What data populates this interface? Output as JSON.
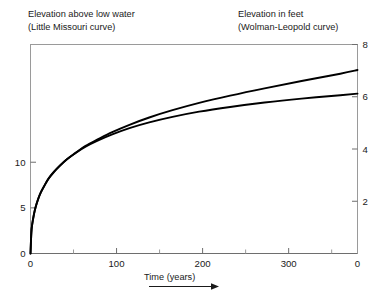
{
  "figure": {
    "caption_left": {
      "line1": "Elevation above low water",
      "line2": "(Little Missouri curve)"
    },
    "caption_right": {
      "line1": "Elevation in feet",
      "line2": "(Wolman-Leopold curve)"
    },
    "arrow_icon": "right-arrow-icon"
  },
  "chart_data": {
    "type": "line",
    "title": "",
    "xlabel": "Time (years)",
    "ylabel_left": "Elevation above low water",
    "ylabel_right": "Elevation in feet",
    "xlim": [
      0,
      380
    ],
    "ylim_left": [
      0,
      22.9
    ],
    "ylim_right": [
      0,
      8
    ],
    "grid": false,
    "legend": "none",
    "xticks": [
      0,
      100,
      200,
      300
    ],
    "xticklabels": [
      "0",
      "100",
      "200",
      "300"
    ],
    "xminorticks": [
      50,
      150,
      250,
      350
    ],
    "yticks_left": [
      0,
      5,
      10
    ],
    "yticklabels_left": [
      "0",
      "5",
      "10"
    ],
    "yticks_right": [
      0,
      2,
      4,
      6,
      8
    ],
    "yticklabels_right": [
      "0",
      "2",
      "4",
      "6",
      "8"
    ],
    "series": [
      {
        "name": "Little Missouri curve",
        "axis": "left",
        "x": [
          0,
          1,
          2,
          4,
          6,
          9,
          12,
          16,
          21,
          27,
          34,
          42,
          52,
          64,
          78,
          95,
          115,
          138,
          165,
          196,
          232,
          272,
          315,
          360,
          380
        ],
        "y": [
          0.0,
          2.3,
          3.2,
          4.3,
          5.1,
          6.0,
          6.7,
          7.4,
          8.2,
          8.9,
          9.6,
          10.3,
          11.0,
          11.8,
          12.5,
          13.3,
          14.1,
          14.9,
          15.7,
          16.5,
          17.3,
          18.1,
          18.9,
          19.7,
          20.1
        ]
      },
      {
        "name": "Wolman-Leopold curve",
        "axis": "right",
        "x": [
          0,
          1,
          2,
          4,
          6,
          9,
          12,
          16,
          21,
          27,
          34,
          42,
          52,
          64,
          78,
          95,
          115,
          138,
          165,
          196,
          232,
          272,
          315,
          360,
          380
        ],
        "y": [
          0.0,
          0.8,
          1.12,
          1.5,
          1.78,
          2.09,
          2.34,
          2.59,
          2.87,
          3.12,
          3.36,
          3.6,
          3.84,
          4.09,
          4.32,
          4.56,
          4.8,
          5.02,
          5.23,
          5.43,
          5.61,
          5.78,
          5.93,
          6.06,
          6.12
        ]
      }
    ]
  }
}
